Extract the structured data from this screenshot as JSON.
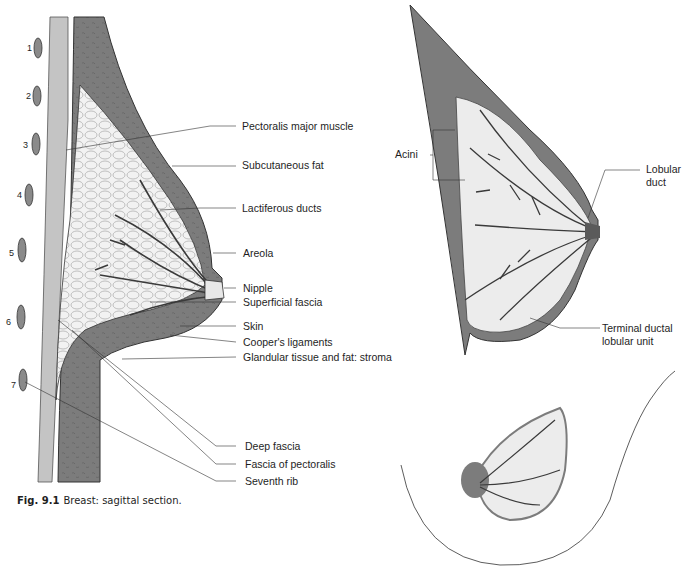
{
  "figure": {
    "caption_number": "Fig. 9.1",
    "caption_text": "Breast: sagittal section."
  },
  "sagittal_section": {
    "rib_numbers": [
      "1",
      "2",
      "3",
      "4",
      "5",
      "6",
      "7"
    ],
    "labels": [
      "Pectoralis major muscle",
      "Subcutaneous fat",
      "Lactiferous ducts",
      "Areola",
      "Nipple",
      "Superficial fascia",
      "Skin",
      "Cooper's ligaments",
      "Glandular tissue and fat: stroma",
      "Deep fascia",
      "Fascia of pectoralis",
      "Seventh rib"
    ]
  },
  "ductal_view": {
    "labels": {
      "acini": "Acini",
      "lobular_duct_line1": "Lobular",
      "lobular_duct_line2": "duct",
      "tdlu_line1": "Terminal ductal",
      "tdlu_line2": "lobular unit"
    }
  },
  "colors": {
    "tissue_dark": "#7c7c7c",
    "chest_wall": "#c4c4c4",
    "fat_light": "#ececec",
    "duct": "#3a3a3a",
    "leader_line": "#333333"
  }
}
